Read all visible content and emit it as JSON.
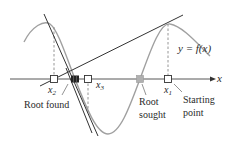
{
  "labels": {
    "curve": "y = f(x)",
    "axis": "x",
    "x1": "x",
    "x1_sub": "1",
    "x2": "x",
    "x2_sub": "2",
    "x3": "x",
    "x3_sub": "3",
    "root_found": "Root found",
    "root_sought_line1": "Root",
    "root_sought_line2": "sought",
    "starting_point_line1": "Starting",
    "starting_point_line2": "point"
  },
  "colors": {
    "curve": "#9a9a9a",
    "tangent": "#333333",
    "axis": "#444444",
    "dashed": "#8a8a8a",
    "root_found_marker": "#222222",
    "root_sought_marker": "#aaaaaa",
    "text": "#2a2a2a"
  }
}
